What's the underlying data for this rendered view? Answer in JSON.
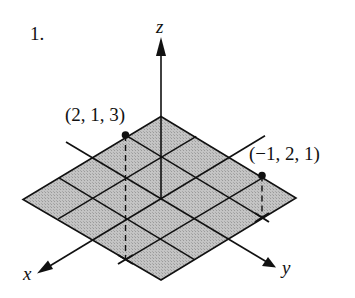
{
  "problem_number": "1.",
  "axes": {
    "x_label": "x",
    "y_label": "y",
    "z_label": "z"
  },
  "points": [
    {
      "label": "(2, 1, 3)",
      "x": 2,
      "y": 1,
      "z": 3
    },
    {
      "label": "(−1, 2, 1)",
      "x": -1,
      "y": 2,
      "z": 1
    }
  ],
  "grid": {
    "cells_per_side": 4,
    "range_x": [
      -2,
      2
    ],
    "range_y": [
      -2,
      2
    ],
    "fill_color": "#b8b8b8",
    "line_color": "#111111"
  },
  "colors": {
    "ink": "#111111",
    "background": "#ffffff"
  }
}
